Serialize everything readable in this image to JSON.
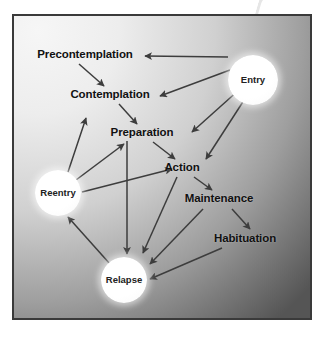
{
  "figure": {
    "kind": "flow-diagram",
    "frame_color": "#3a3a3a",
    "background": {
      "light_color": "#f2f2f2",
      "dark_color": "#575757",
      "gradient": "radial, light at top-left to dark at bottom-right"
    },
    "arrow_color": "#3d3d3d",
    "label_color": "#111111"
  },
  "nodes": [
    {
      "id": "precontemplation",
      "label": "Precontemplation",
      "shape": "text",
      "x": 85,
      "y": 55,
      "font_size": 11.5
    },
    {
      "id": "contemplation",
      "label": "Contemplation",
      "shape": "text",
      "x": 110,
      "y": 95,
      "font_size": 11.5
    },
    {
      "id": "preparation",
      "label": "Preparation",
      "shape": "text",
      "x": 142,
      "y": 133,
      "font_size": 11.5
    },
    {
      "id": "action",
      "label": "Action",
      "shape": "text",
      "x": 182,
      "y": 168,
      "font_size": 11.5
    },
    {
      "id": "maintenance",
      "label": "Maintenance",
      "shape": "text",
      "x": 219,
      "y": 199,
      "font_size": 11.5
    },
    {
      "id": "habituation",
      "label": "Habituation",
      "shape": "text",
      "x": 245,
      "y": 239,
      "font_size": 11.5
    },
    {
      "id": "entry",
      "label": "Entry",
      "shape": "circle",
      "x": 253,
      "y": 80,
      "r": 25,
      "font_size": 9.5
    },
    {
      "id": "reentry",
      "label": "Reentry",
      "shape": "circle",
      "x": 58,
      "y": 193,
      "r": 23,
      "font_size": 9.5
    },
    {
      "id": "relapse",
      "label": "Relapse",
      "shape": "circle",
      "x": 124,
      "y": 280,
      "r": 23,
      "font_size": 9.5
    }
  ],
  "edges": [
    {
      "id": "entry-precontemplation",
      "from": "entry",
      "to": "precontemplation"
    },
    {
      "id": "entry-contemplation",
      "from": "entry",
      "to": "contemplation"
    },
    {
      "id": "entry-preparation",
      "from": "entry",
      "to": "preparation"
    },
    {
      "id": "entry-action",
      "from": "entry",
      "to": "action"
    },
    {
      "id": "precontemplation-contemplation",
      "from": "precontemplation",
      "to": "contemplation"
    },
    {
      "id": "contemplation-preparation",
      "from": "contemplation",
      "to": "preparation"
    },
    {
      "id": "preparation-action",
      "from": "preparation",
      "to": "action"
    },
    {
      "id": "action-maintenance",
      "from": "action",
      "to": "maintenance"
    },
    {
      "id": "maintenance-habituation",
      "from": "maintenance",
      "to": "habituation"
    },
    {
      "id": "preparation-relapse",
      "from": "preparation",
      "to": "relapse"
    },
    {
      "id": "action-relapse",
      "from": "action",
      "to": "relapse"
    },
    {
      "id": "maintenance-relapse",
      "from": "maintenance",
      "to": "relapse"
    },
    {
      "id": "habituation-relapse",
      "from": "habituation",
      "to": "relapse"
    },
    {
      "id": "relapse-reentry",
      "from": "relapse",
      "to": "reentry"
    },
    {
      "id": "reentry-contemplation",
      "from": "reentry",
      "to": "contemplation"
    },
    {
      "id": "reentry-preparation",
      "from": "reentry",
      "to": "preparation"
    },
    {
      "id": "reentry-action",
      "from": "reentry",
      "to": "action"
    }
  ],
  "edge_geometry": [
    {
      "id": "entry-precontemplation",
      "x1": 228,
      "y1": 57,
      "x2": 145,
      "y2": 56
    },
    {
      "id": "entry-contemplation",
      "x1": 230,
      "y1": 70,
      "x2": 160,
      "y2": 96
    },
    {
      "id": "entry-preparation",
      "x1": 240,
      "y1": 89,
      "x2": 192,
      "y2": 132
    },
    {
      "id": "entry-action",
      "x1": 248,
      "y1": 94,
      "x2": 206,
      "y2": 159
    },
    {
      "id": "precontemplation-contemplation",
      "x1": 79,
      "y1": 64,
      "x2": 104,
      "y2": 86
    },
    {
      "id": "contemplation-preparation",
      "x1": 119,
      "y1": 104,
      "x2": 137,
      "y2": 124
    },
    {
      "id": "preparation-action",
      "x1": 153,
      "y1": 142,
      "x2": 175,
      "y2": 159
    },
    {
      "id": "action-maintenance",
      "x1": 194,
      "y1": 177,
      "x2": 212,
      "y2": 190
    },
    {
      "id": "maintenance-habituation",
      "x1": 232,
      "y1": 209,
      "x2": 250,
      "y2": 229
    },
    {
      "id": "preparation-relapse",
      "x1": 127,
      "y1": 141,
      "x2": 127,
      "y2": 254
    },
    {
      "id": "action-relapse",
      "x1": 177,
      "y1": 177,
      "x2": 143,
      "y2": 253
    },
    {
      "id": "maintenance-relapse",
      "x1": 203,
      "y1": 209,
      "x2": 150,
      "y2": 264
    },
    {
      "id": "habituation-relapse",
      "x1": 222,
      "y1": 248,
      "x2": 150,
      "y2": 279
    },
    {
      "id": "relapse-reentry",
      "x1": 110,
      "y1": 264,
      "x2": 68,
      "y2": 217
    },
    {
      "id": "reentry-contemplation",
      "x1": 68,
      "y1": 172,
      "x2": 86,
      "y2": 118
    },
    {
      "id": "reentry-preparation",
      "x1": 72,
      "y1": 183,
      "x2": 124,
      "y2": 144
    },
    {
      "id": "reentry-action",
      "x1": 82,
      "y1": 192,
      "x2": 172,
      "y2": 169
    }
  ]
}
